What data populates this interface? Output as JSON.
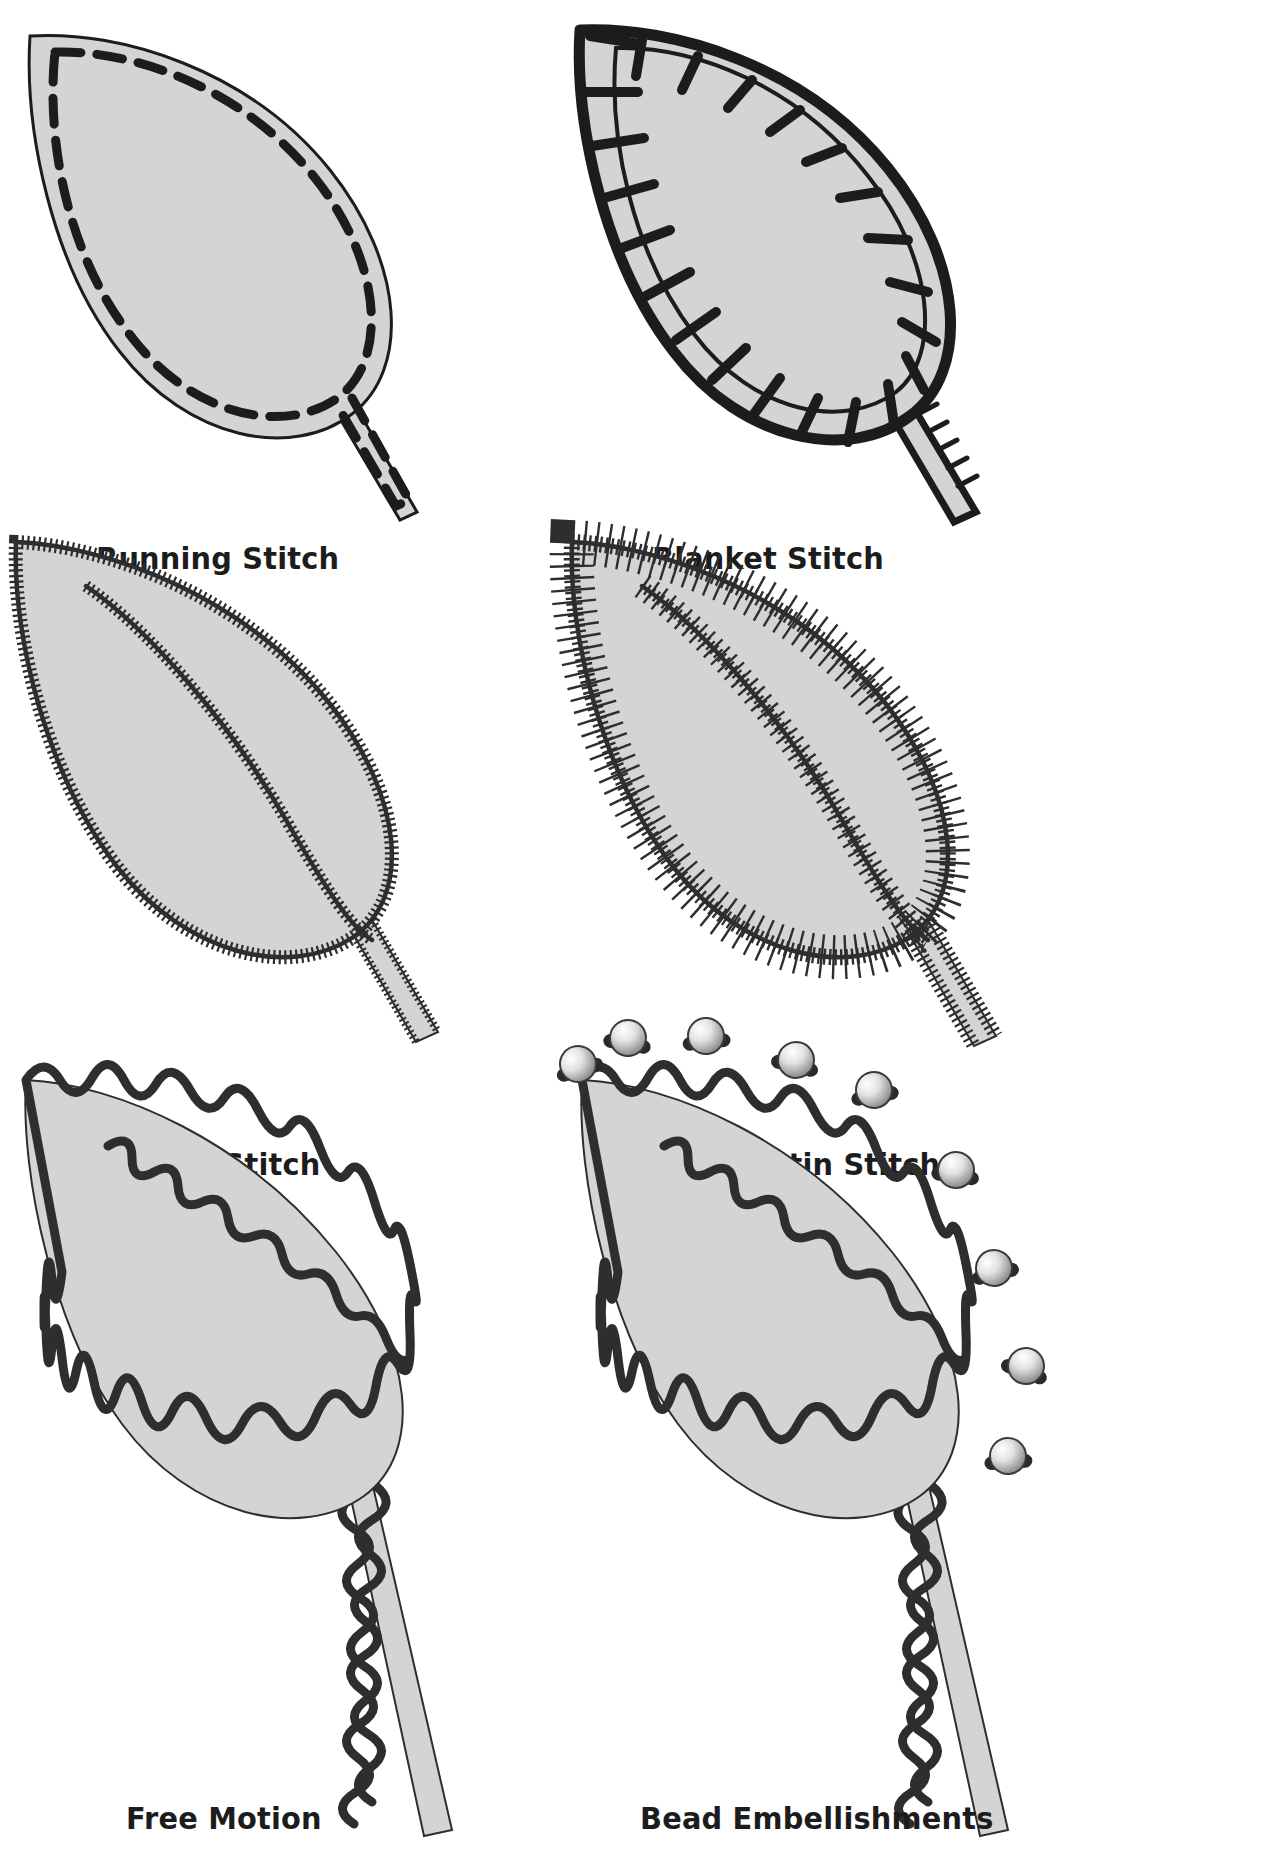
{
  "page": {
    "background_color": "#ffffff",
    "ink_color": "#1c1c1c",
    "leaf_fill_color": "#d4d4d4",
    "leaf_outline_color": "#1c1c1c",
    "bead_highlight_color": "#f2f2f2",
    "bead_shadow_color": "#2a2a2a",
    "columns": 2,
    "rows": 3
  },
  "panels": [
    {
      "id": "running-stitch",
      "label": "Running Stitch",
      "row": 1,
      "column": 1,
      "stitch_type": "running",
      "description": "Dashed line stitched just inside the leaf outline",
      "has_center_vein": false,
      "has_stem": true,
      "beads": 0
    },
    {
      "id": "blanket-stitch",
      "label": "Blanket Stitch",
      "row": 1,
      "column": 2,
      "stitch_type": "blanket",
      "description": "Heavy looped edge stitch with perpendicular legs",
      "has_center_vein": false,
      "has_stem": true,
      "beads": 0
    },
    {
      "id": "satin-stitch",
      "label": "Satin Stitch",
      "row": 2,
      "column": 1,
      "stitch_type": "satin",
      "description": "Dense short zigzag edge with centre vein",
      "has_center_vein": true,
      "has_stem": true,
      "beads": 0
    },
    {
      "id": "varied-satin-stitch",
      "label": "Varied Satin Stitch",
      "row": 2,
      "column": 2,
      "stitch_type": "varied-satin",
      "description": "Zigzag edge with alternating long and short spikes",
      "has_center_vein": true,
      "has_stem": true,
      "beads": 0
    },
    {
      "id": "free-motion",
      "label": "Free Motion",
      "row": 3,
      "column": 1,
      "stitch_type": "free-motion",
      "description": "Loose looping scribbled free motion line",
      "has_center_vein": true,
      "has_stem": true,
      "beads": 0
    },
    {
      "id": "bead-embellishments",
      "label": "Bead Embellishments",
      "row": 3,
      "column": 2,
      "stitch_type": "free-motion",
      "description": "Free motion leaf scattered with round beads",
      "has_center_vein": true,
      "has_stem": true,
      "beads": 9
    }
  ],
  "captions": {
    "running": "Running Stitch",
    "blanket": "Blanket Stitch",
    "satin": "Satin Stitch",
    "varied_satin": "Varied Satin Stitch",
    "free_motion": "Free Motion",
    "bead": "Bead Embellishments"
  }
}
